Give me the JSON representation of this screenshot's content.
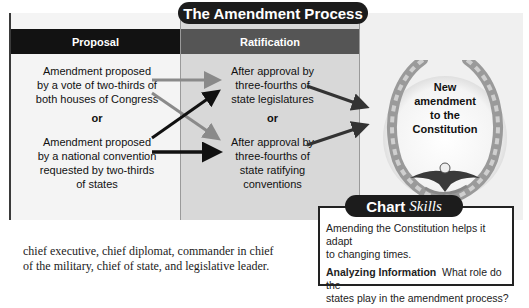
{
  "chart": {
    "title": "The Amendment Process",
    "columns": {
      "proposal": {
        "header": "Proposal",
        "methods": [
          "Amendment proposed by a vote of two-thirds of both houses of Congress",
          "Amendment proposed by a national convention requested by two-thirds of states"
        ],
        "method_lines": [
          [
            "Amendment proposed",
            "by a vote of two-thirds of",
            "both houses of Congress"
          ],
          [
            "Amendment proposed",
            "by a national convention",
            "requested by two-thirds",
            "of states"
          ]
        ],
        "separator": "or"
      },
      "ratification": {
        "header": "Ratification",
        "method_lines": [
          [
            "After approval by",
            "three-fourths of",
            "state legislatures"
          ],
          [
            "After approval by",
            "three-fourths of",
            "state ratifying",
            "conventions"
          ]
        ],
        "separator": "or"
      },
      "result": {
        "lines": [
          "New",
          "amendment",
          "to the",
          "Constitution"
        ],
        "icon": "laurel-wreath-eagle-icon"
      }
    },
    "colors": {
      "frame": "#3a3a3a",
      "header_dark": "#121212",
      "header_mid": "#555555",
      "ratification_bg": "#d8d8d8",
      "arrow_black": "#111111",
      "arrow_gray": "#8a8a8a"
    }
  },
  "body_text": {
    "lines": [
      "chief executive, chief diplomat, commander in chief",
      "of the military, chief of state, and legislative leader."
    ]
  },
  "chart_skills": {
    "title_bold": "Chart",
    "title_italic": "Skills",
    "paragraph1_lines": [
      "Amending the Constitution helps it adapt",
      "to changing times."
    ],
    "label": "Analyzing Information",
    "question_first": "What role do the",
    "question_second": "states play in the amendment process?"
  }
}
